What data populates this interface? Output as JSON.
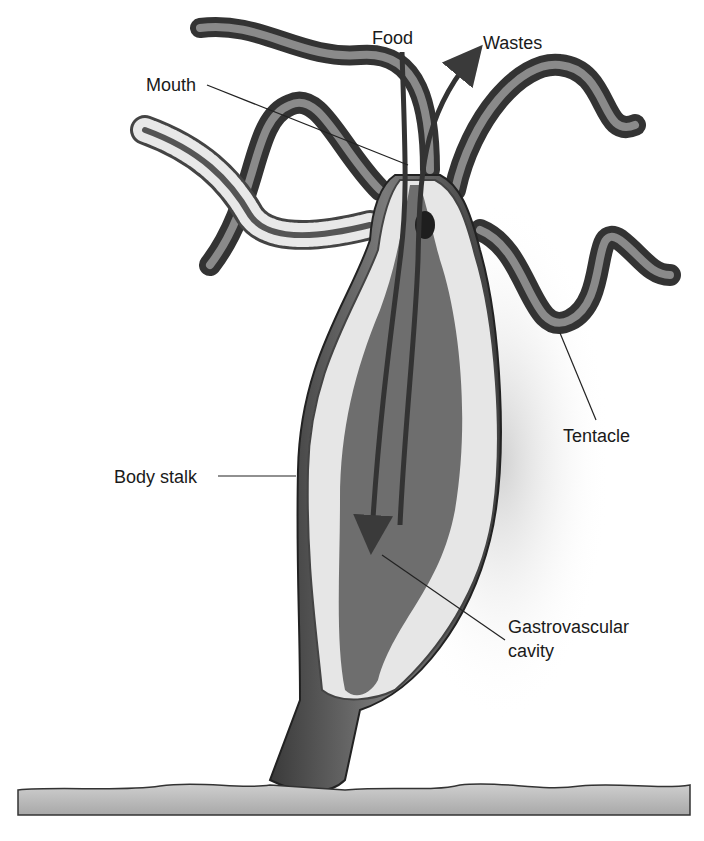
{
  "diagram": {
    "labels": {
      "food": "Food",
      "wastes": "Wastes",
      "mouth": "Mouth",
      "tentacle": "Tentacle",
      "body_stalk": "Body stalk",
      "gastrovascular_line1": "Gastrovascular",
      "gastrovascular_line2": "cavity"
    },
    "colors": {
      "background": "#ffffff",
      "body_dark": "#4a4a4a",
      "tissue_light": "#e6e6e6",
      "cavity": "#6e6e6e",
      "ground": "#b8b8b8",
      "label_text": "#1a1a1a"
    }
  }
}
